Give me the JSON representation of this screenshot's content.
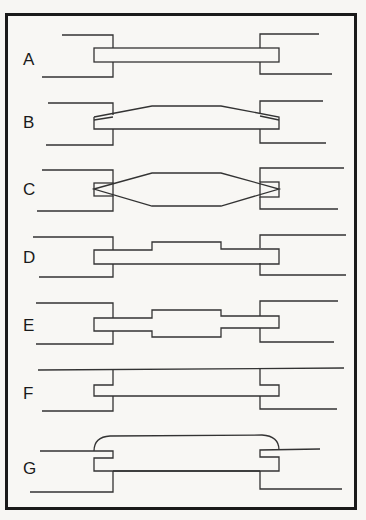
{
  "figure": {
    "panels": [
      {
        "label": "A",
        "description": "Uniform bar spanning gap, embedded in both sides"
      },
      {
        "label": "B",
        "description": "Bar with tapered top, thicker in middle"
      },
      {
        "label": "C",
        "description": "Double-tapered diamond-like bar, thick in middle, thin at ends"
      },
      {
        "label": "D",
        "description": "Uniform bar with raised step on top in middle"
      },
      {
        "label": "E",
        "description": "Bar with thicker middle section, stepped on both sides"
      },
      {
        "label": "F",
        "description": "Bar under continuous top line, embedded at ends"
      },
      {
        "label": "G",
        "description": "Bar with rounded arch cap over gap, hooked ends"
      }
    ]
  }
}
